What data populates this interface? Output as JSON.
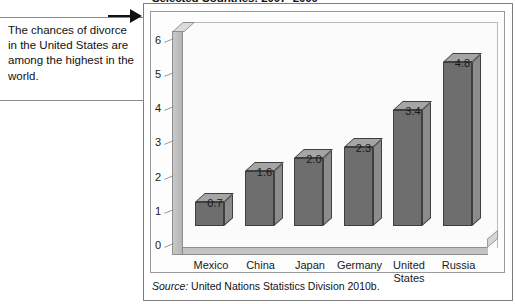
{
  "chart_title": "Selected Countries: 2007–2009",
  "callout": {
    "text": "The chances of divorce in the United States are among the highest in the world.",
    "pointer_icon": "right-arrow-icon"
  },
  "source": {
    "label": "Source:",
    "text": " United Nations Statistics Division 2010b."
  },
  "axis": {
    "y_ticks": [
      "0",
      "1",
      "2",
      "3",
      "4",
      "5",
      "6"
    ]
  },
  "colors": {
    "bar_front": "#6e6e6e",
    "bar_top": "#a5a5a5",
    "bar_side": "#8c8c8c",
    "frame": "#7d7d7d",
    "plot_background": "#fdfdfd"
  },
  "chart_data": {
    "type": "bar",
    "title": "Selected Countries: 2007–2009",
    "xlabel": "",
    "ylabel": "",
    "ylim": [
      0,
      6.5
    ],
    "grid": false,
    "legend": "none",
    "categories": [
      "Mexico",
      "China",
      "Japan",
      "Germany",
      "United States",
      "Russia"
    ],
    "values": [
      0.7,
      1.6,
      2.0,
      2.3,
      3.4,
      4.8
    ],
    "data_labels": [
      "0.7",
      "1.6",
      "2.0",
      "2.3",
      "3.4",
      "4.8"
    ],
    "tick_labels": [
      "0",
      "1",
      "2",
      "3",
      "4",
      "5",
      "6"
    ],
    "source": "Source: United Nations Statistics Division 2010b.",
    "annotation": "The chances of divorce in the United States are among the highest in the world."
  }
}
